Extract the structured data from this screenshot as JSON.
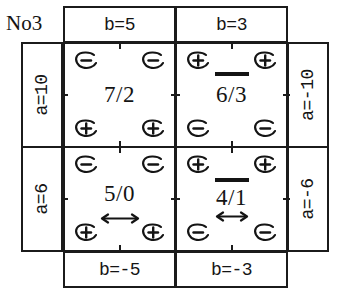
{
  "title": "No3",
  "axes": {
    "top_labels": [
      "b=5",
      "b=3"
    ],
    "bottom_labels": [
      "b=-5",
      "b=-3"
    ],
    "left_labels": [
      "a=10",
      "a=6"
    ],
    "right_labels": [
      "a=-10",
      "a=-6"
    ]
  },
  "colors": {
    "ink": "#1b1b1b",
    "text": "#141414",
    "background": "#ffffff"
  },
  "cells": [
    {
      "position": "top-left",
      "value": "7/2",
      "numerator": "7",
      "denominator": "2",
      "overbar": false,
      "double_arrow": false,
      "corners": {
        "top_left": "-",
        "top_right": "-",
        "bottom_left": "+",
        "bottom_right": "+"
      }
    },
    {
      "position": "top-right",
      "value": "6/3",
      "numerator": "6",
      "denominator": "3",
      "overbar": true,
      "double_arrow": false,
      "corners": {
        "top_left": "+",
        "top_right": "+",
        "bottom_left": "-",
        "bottom_right": "-"
      }
    },
    {
      "position": "bottom-left",
      "value": "5/0",
      "numerator": "5",
      "denominator": "0",
      "overbar": false,
      "double_arrow": true,
      "corners": {
        "top_left": "-",
        "top_right": "-",
        "bottom_left": "+",
        "bottom_right": "+"
      }
    },
    {
      "position": "bottom-right",
      "value": "4/1",
      "numerator": "4",
      "denominator": "1",
      "overbar": true,
      "double_arrow": true,
      "corners": {
        "top_left": "+",
        "top_right": "+",
        "bottom_left": "-",
        "bottom_right": "-"
      }
    }
  ]
}
